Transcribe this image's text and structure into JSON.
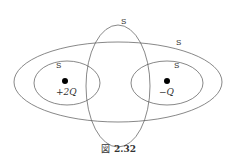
{
  "figure": {
    "caption_prefix": "図",
    "caption_number": "2.32"
  },
  "surfaces": [
    {
      "id": "vertical",
      "label": "S",
      "subscript": ""
    },
    {
      "id": "large",
      "label": "S",
      "subscript": ""
    },
    {
      "id": "left",
      "label": "S",
      "subscript": ""
    },
    {
      "id": "right",
      "label": "S",
      "subscript": ""
    }
  ],
  "charges": [
    {
      "id": "left",
      "value": "+2Q"
    },
    {
      "id": "right",
      "value": "−Q"
    }
  ],
  "colors": {
    "line": "#555555",
    "text": "#333333",
    "dot": "#000000"
  }
}
